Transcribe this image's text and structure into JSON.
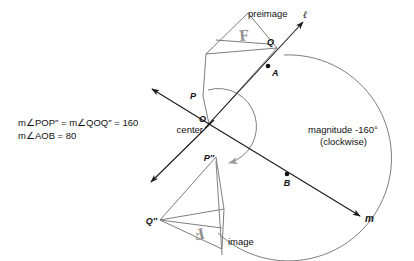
{
  "figure": {
    "type": "geometry-rotation-diagram",
    "background": "#ffffff",
    "colors": {
      "line_dark": "#1a1a1a",
      "line_gray": "#8a8a8a",
      "line_mid": "#6e6e6e",
      "f_glyph": "#9c9c9c",
      "text": "#111111"
    }
  },
  "equations": {
    "line1": "m∠POP″ = m∠QOQ″ = 160",
    "line2": "m∠AOB = 80"
  },
  "labels": {
    "preimage": "preimage",
    "image": "image",
    "center": "center",
    "magnitude_line1": "magnitude -160°",
    "magnitude_line2": "(clockwise)"
  },
  "points": {
    "O": "O",
    "P": "P",
    "Q": "Q",
    "A": "A",
    "B": "B",
    "P_double_prime": "P″",
    "Q_double_prime": "Q″"
  },
  "lines": {
    "ell": "ℓ",
    "m": "m"
  },
  "glyphs": {
    "preimage_letter": "F",
    "image_letter": "F"
  },
  "geometry": {
    "center_xy": [
      209,
      124
    ],
    "P_xy": [
      203,
      96
    ],
    "Q_xy": [
      277,
      48
    ],
    "A_xy": [
      268,
      66
    ],
    "B_xy": [
      287,
      174
    ],
    "P2_xy": [
      216,
      157
    ],
    "Q2_xy": [
      160,
      220
    ],
    "angle_rotation_deg": -160,
    "angle_AOB_deg": 80
  }
}
